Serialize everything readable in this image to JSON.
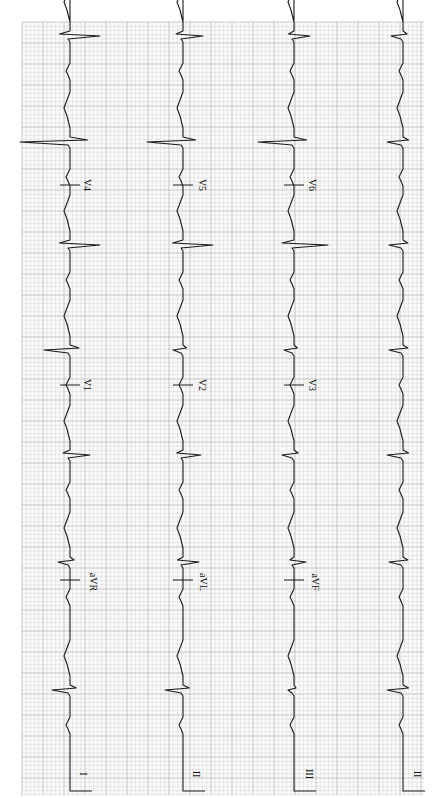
{
  "chart_data": {
    "type": "line",
    "orientation": "rotated-90-cw",
    "grid": true,
    "grid_color": "#b9b9b9",
    "trace_color": "#1a1a1a",
    "paper": {
      "x0": 22,
      "y0": 22,
      "x1": 424,
      "y1": 795,
      "minor": 4.2,
      "major": 21
    },
    "rows": [
      {
        "baseline_x": 70,
        "segments": [
          {
            "label": "I",
            "y_start": 795,
            "y_end": 580
          },
          {
            "label": "aVR",
            "y_start": 580,
            "y_end": 385
          },
          {
            "label": "V1",
            "y_start": 385,
            "y_end": 185
          },
          {
            "label": "V4",
            "y_start": 185,
            "y_end": 22
          }
        ]
      },
      {
        "baseline_x": 183,
        "segments": [
          {
            "label": "II",
            "y_start": 795,
            "y_end": 580
          },
          {
            "label": "aVL",
            "y_start": 580,
            "y_end": 385
          },
          {
            "label": "V2",
            "y_start": 385,
            "y_end": 185
          },
          {
            "label": "V5",
            "y_start": 185,
            "y_end": 22
          }
        ]
      },
      {
        "baseline_x": 294,
        "segments": [
          {
            "label": "III",
            "y_start": 795,
            "y_end": 580
          },
          {
            "label": "aVF",
            "y_start": 580,
            "y_end": 385
          },
          {
            "label": "V3",
            "y_start": 385,
            "y_end": 185
          },
          {
            "label": "V6",
            "y_start": 185,
            "y_end": 22
          }
        ]
      },
      {
        "baseline_x": 403,
        "segments": [
          {
            "label": "II",
            "y_start": 795,
            "y_end": 22
          }
        ]
      }
    ],
    "beats_y": [
      690,
      562,
      455,
      350,
      245,
      142,
      36
    ],
    "qrs_amplitudes": [
      {
        "row": 0,
        "values": [
          -18,
          -12,
          20,
          -26,
          30,
          -50,
          30
        ]
      },
      {
        "row": 1,
        "values": [
          -18,
          16,
          18,
          -10,
          30,
          -36,
          20
        ]
      },
      {
        "row": 2,
        "values": [
          -6,
          12,
          -12,
          -10,
          34,
          -36,
          16
        ]
      },
      {
        "row": 3,
        "values": [
          -16,
          -14,
          -16,
          -14,
          -14,
          -16,
          -12
        ]
      }
    ],
    "labels": [
      {
        "text": "I",
        "x": 80,
        "y": 774
      },
      {
        "text": "II",
        "x": 193,
        "y": 774
      },
      {
        "text": "III",
        "x": 306,
        "y": 774
      },
      {
        "text": "II",
        "x": 414,
        "y": 774
      },
      {
        "text": "aVR",
        "x": 90,
        "y": 582
      },
      {
        "text": "aVL",
        "x": 200,
        "y": 582
      },
      {
        "text": "aVF",
        "x": 312,
        "y": 582
      },
      {
        "text": "V1",
        "x": 84,
        "y": 385
      },
      {
        "text": "V2",
        "x": 199,
        "y": 385
      },
      {
        "text": "V3",
        "x": 309,
        "y": 385
      },
      {
        "text": "V4",
        "x": 84,
        "y": 185
      },
      {
        "text": "V5",
        "x": 199,
        "y": 185
      },
      {
        "text": "V6",
        "x": 309,
        "y": 185
      }
    ],
    "lead_markers_y": [
      580,
      385,
      185
    ],
    "xlabel": "",
    "ylabel": ""
  }
}
